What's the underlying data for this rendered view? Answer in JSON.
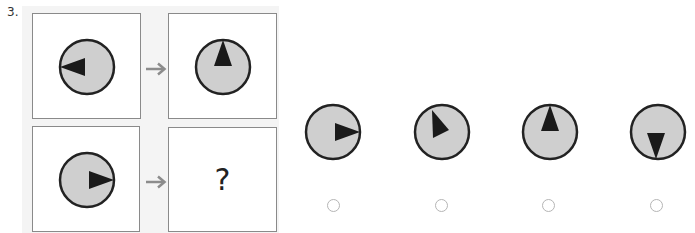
{
  "question": {
    "number": "3.",
    "unknown_symbol": "?",
    "analogy": {
      "top_left": {
        "dial_pointer_direction": "left",
        "angle_deg": 270
      },
      "top_right": {
        "dial_pointer_direction": "up",
        "angle_deg": 0
      },
      "bottom_left": {
        "dial_pointer_direction": "right",
        "angle_deg": 90
      },
      "bottom_right": {
        "dial_pointer_direction": "unknown"
      }
    },
    "arrow_icon": "right-arrow-icon",
    "options": [
      {
        "id": "A",
        "dial_pointer_direction": "right",
        "angle_deg": 90,
        "selected": false
      },
      {
        "id": "B",
        "dial_pointer_direction": "up-right (tilted)",
        "angle_deg": 150,
        "selected": false
      },
      {
        "id": "C",
        "dial_pointer_direction": "up",
        "angle_deg": 0,
        "selected": false
      },
      {
        "id": "D",
        "dial_pointer_direction": "down",
        "angle_deg": 180,
        "selected": false
      }
    ]
  },
  "colors": {
    "dial_fill": "#cfcfcf",
    "dial_stroke": "#222222",
    "pointer": "#1a1a1a",
    "arrow": "#8c8c8c",
    "box_border": "#8a8a8a",
    "radio_border": "#b5b5b5"
  }
}
